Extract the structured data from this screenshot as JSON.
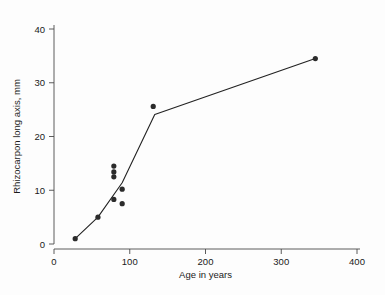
{
  "chart_data": {
    "type": "scatter",
    "title": "",
    "xlabel": "Age in years",
    "ylabel": "Rhizocarpon long axis, mm",
    "xlim": [
      0,
      400
    ],
    "ylim": [
      0,
      40
    ],
    "xticks": [
      0,
      100,
      200,
      300,
      400
    ],
    "yticks": [
      0,
      10,
      20,
      30,
      40
    ],
    "xtick_labels": [
      "0",
      "100",
      "200",
      "300",
      "400"
    ],
    "ytick_labels": [
      "0",
      "10",
      "20",
      "30",
      "40"
    ],
    "grid": false,
    "legend": null,
    "legend_position": "none",
    "series": [
      {
        "name": "Rhizocarpon measurements",
        "marker": "filled-circle",
        "color": "#2b2b2b",
        "points": [
          {
            "x": 28,
            "y": 1.0
          },
          {
            "x": 58,
            "y": 5.0
          },
          {
            "x": 79,
            "y": 14.5
          },
          {
            "x": 79,
            "y": 13.4
          },
          {
            "x": 79,
            "y": 12.5
          },
          {
            "x": 90,
            "y": 10.2
          },
          {
            "x": 79,
            "y": 8.3
          },
          {
            "x": 90,
            "y": 7.5
          },
          {
            "x": 131,
            "y": 25.6
          },
          {
            "x": 345,
            "y": 34.5
          }
        ]
      },
      {
        "name": "Fitted growth curve",
        "marker": "none",
        "color": "#222222",
        "line_points": [
          {
            "x": 28,
            "y": 1.0
          },
          {
            "x": 58,
            "y": 5.0
          },
          {
            "x": 90,
            "y": 11.4
          },
          {
            "x": 133,
            "y": 24.1
          },
          {
            "x": 345,
            "y": 34.5
          }
        ]
      }
    ]
  },
  "axes": {
    "x_axis_name": "Age in years",
    "y_axis_name": "Rhizocarpon long axis, mm"
  },
  "colors": {
    "background": "#fdfdfd",
    "axis": "#4a4a4a",
    "marker": "#2b2b2b",
    "line": "#222222",
    "text": "#1a1a1a"
  }
}
